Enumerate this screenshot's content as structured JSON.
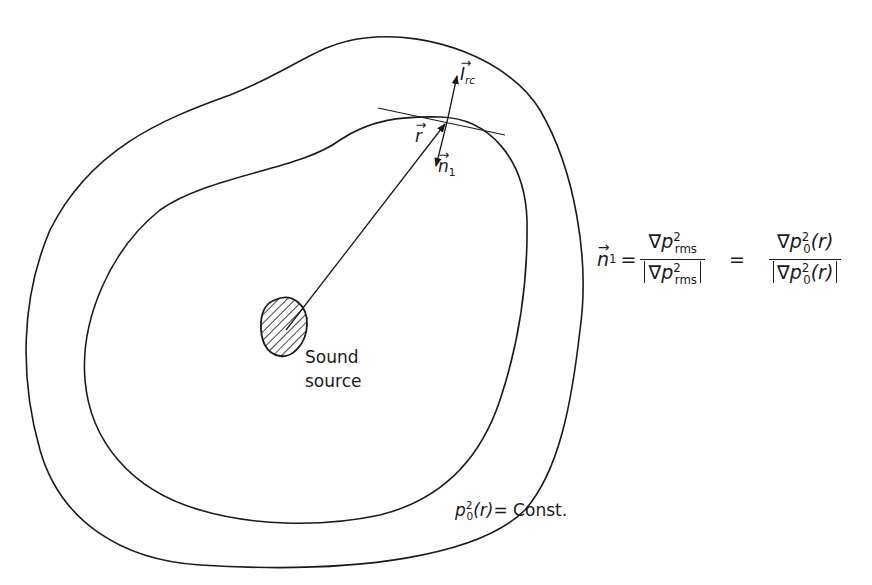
{
  "figure": {
    "labels": {
      "intensity_vector": {
        "symbol": "I",
        "subscript": "rc"
      },
      "position_vector": {
        "symbol": "r"
      },
      "normal_vector": {
        "symbol": "n",
        "subscript": "1"
      },
      "source_line1": "Sound",
      "source_line2": "source",
      "contour": {
        "lhs_symbol": "p",
        "lhs_sub": "0",
        "lhs_sup": "2",
        "arg": "(r)",
        "rhs": "= Const."
      }
    },
    "equation": {
      "lhs": "n",
      "lhs_sub": "1",
      "equals1": "=",
      "equals2": "=",
      "frac1_num": {
        "nabla": "∇",
        "symbol": "p",
        "sub": "rms",
        "sup": "2"
      },
      "frac1_den": {
        "nabla": "∇",
        "symbol": "p",
        "sub": "rms",
        "sup": "2"
      },
      "frac2_num": {
        "nabla": "∇",
        "symbol": "p",
        "sub": "0",
        "sup": "2",
        "arg": "(r)"
      },
      "frac2_den": {
        "nabla": "∇",
        "symbol": "p",
        "sub": "0",
        "sup": "2",
        "arg": "(r)"
      }
    },
    "colors": {
      "ink": "#1a1a1a",
      "background": "#ffffff"
    }
  }
}
